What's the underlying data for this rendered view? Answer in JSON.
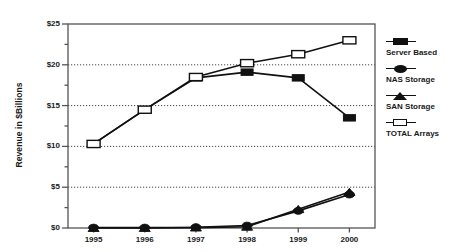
{
  "chart_data": {
    "type": "line",
    "title": "",
    "xlabel": "",
    "ylabel": "Revenue in $Billions",
    "categories": [
      "1995",
      "1996",
      "1997",
      "1998",
      "1999",
      "2000"
    ],
    "x": [
      1995,
      1996,
      1997,
      1998,
      1999,
      2000
    ],
    "ylim": [
      0,
      25
    ],
    "ytick_values": [
      0,
      5,
      10,
      15,
      20,
      25
    ],
    "ytick_labels": [
      "$0",
      "$5",
      "$10",
      "$15",
      "$20",
      "$25"
    ],
    "yminor_step": 2.5,
    "grid": "horizontal-dotted-major",
    "legend_position": "right",
    "series": [
      {
        "name": "Server Based",
        "marker": "filled-square",
        "values": [
          10.3,
          14.5,
          18.4,
          19.1,
          18.4,
          13.5
        ]
      },
      {
        "name": "NAS Storage",
        "marker": "filled-circle",
        "values": [
          0.05,
          0.05,
          0.1,
          0.3,
          2.1,
          4.1
        ]
      },
      {
        "name": "SAN Storage",
        "marker": "filled-triangle",
        "values": [
          0.0,
          0.0,
          0.05,
          0.15,
          2.3,
          4.4
        ]
      },
      {
        "name": "TOTAL Arrays",
        "marker": "open-rectangle",
        "values": [
          10.3,
          14.5,
          18.5,
          20.2,
          21.3,
          23.0
        ]
      }
    ]
  },
  "colors": {
    "line": "#111111",
    "marker_fill": "#111111",
    "marker_open_fill": "#ffffff",
    "axis": "#555555",
    "grid": "#333333",
    "background": "#ffffff",
    "text": "#1a1a1a"
  },
  "legend": {
    "items": [
      {
        "label": "Server Based",
        "marker": "filled-square"
      },
      {
        "label": "NAS Storage",
        "marker": "filled-circle"
      },
      {
        "label": "SAN Storage",
        "marker": "filled-triangle"
      },
      {
        "label": "TOTAL Arrays",
        "marker": "open-rectangle"
      }
    ]
  }
}
